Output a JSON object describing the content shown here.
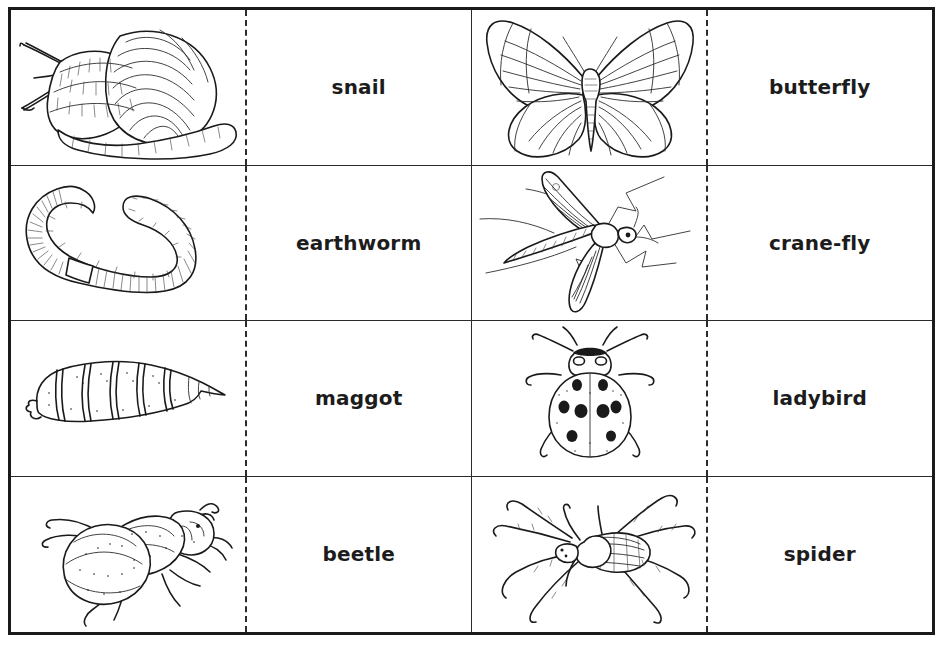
{
  "sheet": {
    "title": "Minibeast picture and word matching cards",
    "columns": 2,
    "rows": 4,
    "border_color": "#1a1a1a",
    "grid_line_color": "#2b2b2b",
    "cut_line_style": "dashed",
    "background": "#ffffff",
    "text_color": "#1c1c1c"
  },
  "cards": [
    {
      "id": "card-snail",
      "label": "snail",
      "illustration": "snail-illustration",
      "column": "left",
      "row": 1
    },
    {
      "id": "card-butterfly",
      "label": "butterfly",
      "illustration": "butterfly-illustration",
      "column": "right",
      "row": 1
    },
    {
      "id": "card-earthworm",
      "label": "earthworm",
      "illustration": "earthworm-illustration",
      "column": "left",
      "row": 2
    },
    {
      "id": "card-crane-fly",
      "label": "crane-fly",
      "illustration": "crane-fly-illustration",
      "column": "right",
      "row": 2
    },
    {
      "id": "card-maggot",
      "label": "maggot",
      "illustration": "maggot-illustration",
      "column": "left",
      "row": 3
    },
    {
      "id": "card-ladybird",
      "label": "ladybird",
      "illustration": "ladybird-illustration",
      "column": "right",
      "row": 3
    },
    {
      "id": "card-beetle",
      "label": "beetle",
      "illustration": "beetle-illustration",
      "column": "left",
      "row": 4
    },
    {
      "id": "card-spider",
      "label": "spider",
      "illustration": "spider-illustration",
      "column": "right",
      "row": 4
    }
  ]
}
